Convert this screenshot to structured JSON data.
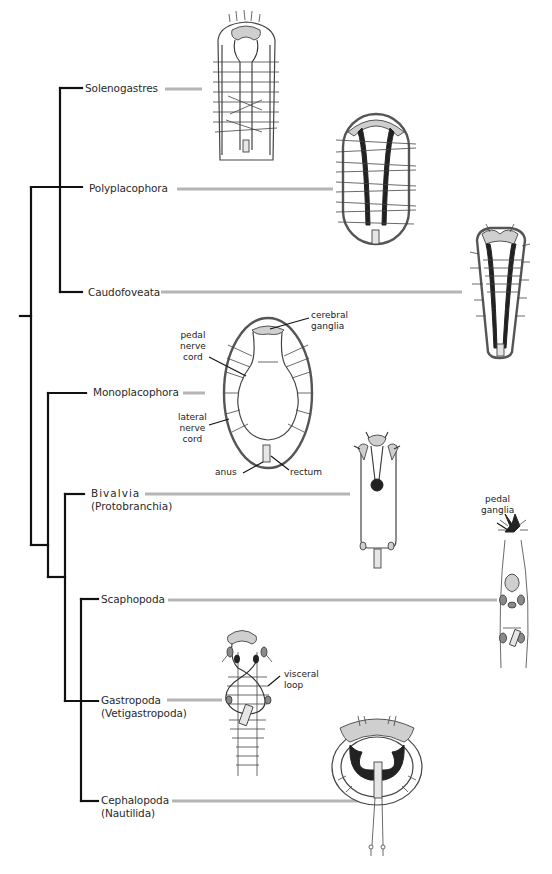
{
  "diagram": {
    "type": "phylogenetic-tree-with-nervous-system-illustrations",
    "taxa": [
      {
        "id": "solenogastres",
        "name": "Solenogastres",
        "sub": ""
      },
      {
        "id": "polyplacophora",
        "name": "Polyplacophora",
        "sub": ""
      },
      {
        "id": "caudofoveata",
        "name": "Caudofoveata",
        "sub": ""
      },
      {
        "id": "monoplacophora",
        "name": "Monoplacophora",
        "sub": ""
      },
      {
        "id": "bivalvia",
        "name": "Bivalvia",
        "sub": "(Protobranchia)"
      },
      {
        "id": "scaphopoda",
        "name": "Scaphopoda",
        "sub": ""
      },
      {
        "id": "gastropoda",
        "name": "Gastropoda",
        "sub": "(Vetigastropoda)"
      },
      {
        "id": "cephalopoda",
        "name": "Cephalopoda",
        "sub": "(Nautilida)"
      }
    ],
    "annotations": {
      "cerebral_ganglia": "cerebral\nganglia",
      "cerebral_1": "cerebral",
      "cerebral_2": "ganglia",
      "pedal_nerve_cord_1": "pedal",
      "pedal_nerve_cord_2": "nerve",
      "pedal_nerve_cord_3": "cord",
      "lateral_nerve_cord_1": "lateral",
      "lateral_nerve_cord_2": "nerve",
      "lateral_nerve_cord_3": "cord",
      "anus": "anus",
      "rectum": "rectum",
      "pedal_ganglia_1": "pedal",
      "pedal_ganglia_2": "ganglia",
      "visceral_loop_1": "visceral",
      "visceral_loop_2": "loop"
    },
    "colors": {
      "tree_lines": "#111111",
      "connector_lines": "#b5b5b5",
      "ganglia_fill": "#cfcfcf",
      "text": "#2a2a2a",
      "background": "#ffffff"
    }
  }
}
